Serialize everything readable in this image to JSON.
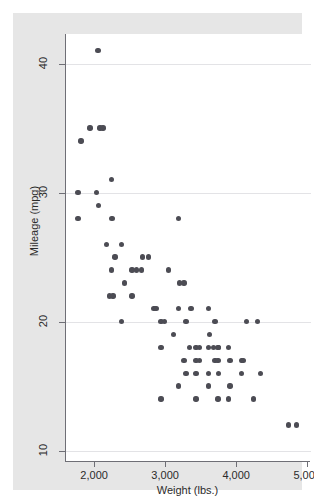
{
  "figure": {
    "background_color": "#e6e6e6",
    "panel_color": "#ffffff",
    "axis_color": "#6f6f76",
    "grid_color": "#e3e3e6",
    "marker_color": "#4c4c54",
    "top_strip_ghost_text": "· · ·"
  },
  "chart_data": {
    "type": "scatter",
    "title": "",
    "xlabel": "Weight (lbs.)",
    "ylabel": "Mileage (mpg)",
    "xlim": [
      1590,
      5040
    ],
    "ylim": [
      9.2,
      42.3
    ],
    "xticks": [
      2000,
      3000,
      4000,
      5000
    ],
    "xticklabels": [
      "2,000",
      "3,000",
      "4,000",
      "5,000"
    ],
    "yticks": [
      10,
      20,
      30,
      40
    ],
    "yticklabels": [
      "10",
      "20",
      "30",
      "40"
    ],
    "grid": "horizontal",
    "legend": "none",
    "marker": "filled-circle",
    "n_points": 74,
    "points": [
      {
        "x": 2040,
        "y": 41
      },
      {
        "x": 1930,
        "y": 35
      },
      {
        "x": 2070,
        "y": 35
      },
      {
        "x": 2110,
        "y": 35
      },
      {
        "x": 1800,
        "y": 34
      },
      {
        "x": 2230,
        "y": 31
      },
      {
        "x": 1760,
        "y": 30
      },
      {
        "x": 2020,
        "y": 30
      },
      {
        "x": 2050,
        "y": 29
      },
      {
        "x": 1760,
        "y": 28
      },
      {
        "x": 2240,
        "y": 28
      },
      {
        "x": 3170,
        "y": 28
      },
      {
        "x": 2160,
        "y": 26
      },
      {
        "x": 2370,
        "y": 26
      },
      {
        "x": 2280,
        "y": 25
      },
      {
        "x": 2670,
        "y": 25
      },
      {
        "x": 2750,
        "y": 25
      },
      {
        "x": 2230,
        "y": 24
      },
      {
        "x": 2520,
        "y": 24
      },
      {
        "x": 2580,
        "y": 24
      },
      {
        "x": 2650,
        "y": 24
      },
      {
        "x": 3030,
        "y": 24
      },
      {
        "x": 2410,
        "y": 23
      },
      {
        "x": 3190,
        "y": 23
      },
      {
        "x": 3250,
        "y": 23
      },
      {
        "x": 2200,
        "y": 22
      },
      {
        "x": 2250,
        "y": 22
      },
      {
        "x": 2520,
        "y": 22
      },
      {
        "x": 2830,
        "y": 21
      },
      {
        "x": 2860,
        "y": 21
      },
      {
        "x": 3170,
        "y": 21
      },
      {
        "x": 3350,
        "y": 21
      },
      {
        "x": 3600,
        "y": 21
      },
      {
        "x": 2370,
        "y": 20
      },
      {
        "x": 2930,
        "y": 20
      },
      {
        "x": 2980,
        "y": 20
      },
      {
        "x": 3280,
        "y": 20
      },
      {
        "x": 3690,
        "y": 20
      },
      {
        "x": 4130,
        "y": 20
      },
      {
        "x": 4290,
        "y": 20
      },
      {
        "x": 3100,
        "y": 19
      },
      {
        "x": 3610,
        "y": 19
      },
      {
        "x": 3330,
        "y": 18
      },
      {
        "x": 3420,
        "y": 18
      },
      {
        "x": 3470,
        "y": 18
      },
      {
        "x": 3600,
        "y": 18
      },
      {
        "x": 3670,
        "y": 18
      },
      {
        "x": 3730,
        "y": 18
      },
      {
        "x": 3740,
        "y": 18
      },
      {
        "x": 3880,
        "y": 18
      },
      {
        "x": 2930,
        "y": 18
      },
      {
        "x": 3250,
        "y": 17
      },
      {
        "x": 3420,
        "y": 17
      },
      {
        "x": 3470,
        "y": 17
      },
      {
        "x": 3690,
        "y": 17
      },
      {
        "x": 3730,
        "y": 17
      },
      {
        "x": 3900,
        "y": 17
      },
      {
        "x": 4060,
        "y": 17
      },
      {
        "x": 4080,
        "y": 17
      },
      {
        "x": 3280,
        "y": 16
      },
      {
        "x": 3420,
        "y": 16
      },
      {
        "x": 3600,
        "y": 16
      },
      {
        "x": 3740,
        "y": 16
      },
      {
        "x": 4060,
        "y": 16
      },
      {
        "x": 4330,
        "y": 16
      },
      {
        "x": 3170,
        "y": 15
      },
      {
        "x": 3600,
        "y": 15
      },
      {
        "x": 3900,
        "y": 15
      },
      {
        "x": 2930,
        "y": 14
      },
      {
        "x": 3420,
        "y": 14
      },
      {
        "x": 3730,
        "y": 14
      },
      {
        "x": 3880,
        "y": 14
      },
      {
        "x": 4230,
        "y": 14
      },
      {
        "x": 4720,
        "y": 12
      },
      {
        "x": 4840,
        "y": 12
      }
    ]
  }
}
